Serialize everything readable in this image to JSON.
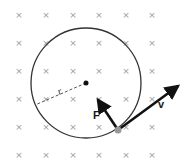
{
  "field": {
    "symbol": "×",
    "color": "#9a9a9a",
    "columns_x": [
      19,
      46,
      73,
      99,
      126,
      152
    ],
    "rows_y": [
      15,
      43,
      71,
      99,
      127,
      155
    ]
  },
  "orbit": {
    "cx": 86,
    "cy": 83,
    "r": 55,
    "color": "#333333"
  },
  "center_dot": {
    "cx": 86,
    "cy": 83,
    "r": 2.5,
    "color": "#111111"
  },
  "radius_line": {
    "x1": 86,
    "y1": 83,
    "x2": 35,
    "y2": 105,
    "color": "#555555"
  },
  "particle": {
    "cx": 118,
    "cy": 130,
    "r": 3.5,
    "color": "#999999"
  },
  "velocity_vector": {
    "x1": 118,
    "y1": 130,
    "x2": 178,
    "y2": 86,
    "color": "#111111"
  },
  "force_vector": {
    "x1": 118,
    "y1": 130,
    "x2": 98,
    "y2": 100,
    "color": "#111111"
  },
  "labels": {
    "radius": "r",
    "force": "F",
    "velocity": "v"
  }
}
